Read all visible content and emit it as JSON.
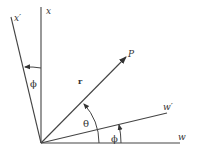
{
  "diagram": {
    "type": "coordinate-rotation",
    "colors": {
      "line": "#444444",
      "text": "#333333",
      "background": "#ffffff"
    },
    "axes": {
      "x": {
        "label": "x"
      },
      "x_prime": {
        "label": "x′"
      },
      "w": {
        "label": "w"
      },
      "w_prime": {
        "label": "w′"
      }
    },
    "vector": {
      "label": "r",
      "point": "P"
    },
    "angles": {
      "theta": "θ",
      "phi_bottom": "ϕ",
      "phi_top": "ϕ"
    }
  }
}
